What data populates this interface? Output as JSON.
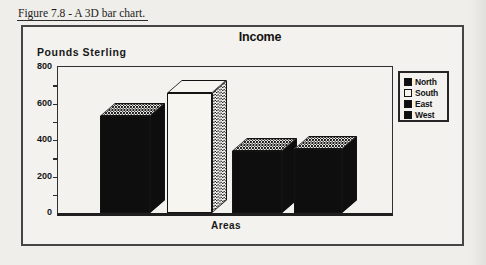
{
  "caption": "Figure 7.8 - A 3D bar chart.",
  "chart_data": {
    "type": "bar",
    "projection": "3d",
    "title": "Income",
    "xlabel": "Areas",
    "ylabel": "Pounds Sterling",
    "ylim": [
      0,
      800
    ],
    "y_ticks": [
      0,
      200,
      400,
      600,
      800
    ],
    "y_minor_tick_step": 100,
    "grid": false,
    "legend_position": "right",
    "categories": [
      "North",
      "South",
      "East",
      "West"
    ],
    "values": [
      530,
      660,
      340,
      350
    ],
    "series": [
      {
        "name": "North",
        "value": 530,
        "front": "#0e0e0e",
        "top": "dither",
        "side": "#0e0e0e"
      },
      {
        "name": "South",
        "value": 660,
        "front": "#f6f5f0",
        "top": "#f6f5f0",
        "side": "dither"
      },
      {
        "name": "East",
        "value": 340,
        "front": "#0e0e0e",
        "top": "dither",
        "side": "#0e0e0e"
      },
      {
        "name": "West",
        "value": 350,
        "front": "#0e0e0e",
        "top": "dither",
        "side": "#0e0e0e"
      }
    ]
  },
  "colors": {
    "ink": "#2b2b2b",
    "paper": "#efeeea",
    "bar_black": "#0e0e0e",
    "bar_white": "#f6f5f0"
  }
}
